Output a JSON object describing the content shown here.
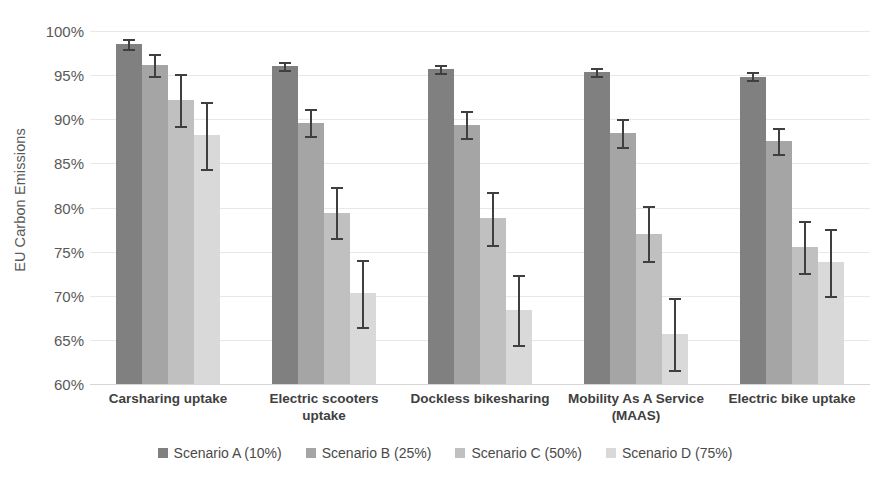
{
  "chart_data": {
    "type": "bar",
    "title": "",
    "subtitle": "",
    "xlabel": "",
    "ylabel": "EU Carbon Emissions",
    "ylim": [
      60,
      100
    ],
    "ytick_values": [
      60,
      65,
      70,
      75,
      80,
      85,
      90,
      95,
      100
    ],
    "ytick_labels": [
      "60%",
      "65%",
      "70%",
      "75%",
      "80%",
      "85%",
      "90%",
      "95%",
      "100%"
    ],
    "grid": true,
    "legend_position": "bottom",
    "error_bars": true,
    "categories": [
      "Carsharing uptake",
      "Electric scooters uptake",
      "Dockless bikesharing",
      "Mobility As A Service (MAAS)",
      "Electric bike uptake"
    ],
    "category_lines": [
      [
        "Carsharing uptake"
      ],
      [
        "Electric scooters uptake"
      ],
      [
        "Dockless bikesharing"
      ],
      [
        "Mobility As A Service",
        "(MAAS)"
      ],
      [
        "Electric bike uptake"
      ]
    ],
    "series": [
      {
        "name": "Scenario A (10%)",
        "color": "#808080",
        "values": [
          98.5,
          96.0,
          95.7,
          95.3,
          94.8
        ],
        "err_low": [
          98.0,
          95.6,
          95.2,
          94.9,
          94.4
        ],
        "err_high": [
          99.1,
          96.5,
          96.2,
          95.8,
          95.3
        ]
      },
      {
        "name": "Scenario B (25%)",
        "color": "#a5a5a5",
        "values": [
          96.1,
          89.6,
          89.3,
          88.4,
          87.5
        ],
        "err_low": [
          94.9,
          88.1,
          87.9,
          86.9,
          86.1
        ],
        "err_high": [
          97.4,
          91.2,
          90.9,
          90.0,
          89.0
        ]
      },
      {
        "name": "Scenario C (50%)",
        "color": "#c0c0c0",
        "values": [
          92.2,
          79.4,
          78.8,
          77.0,
          75.5
        ],
        "err_low": [
          89.2,
          76.5,
          75.8,
          73.9,
          72.6
        ],
        "err_high": [
          95.1,
          82.3,
          81.8,
          80.2,
          78.5
        ]
      },
      {
        "name": "Scenario D (75%)",
        "color": "#d9d9d9",
        "values": [
          88.2,
          70.3,
          68.4,
          65.7,
          73.8
        ],
        "err_low": [
          84.4,
          66.5,
          64.4,
          61.6,
          70.0
        ],
        "err_high": [
          91.9,
          74.1,
          72.4,
          69.8,
          77.6
        ]
      }
    ]
  },
  "axis": {
    "y_title": "EU Carbon Emissions"
  }
}
